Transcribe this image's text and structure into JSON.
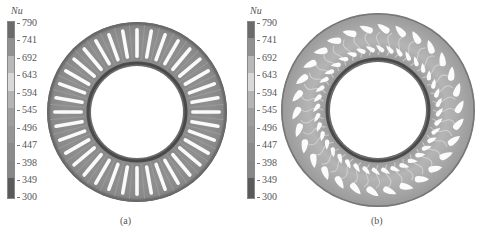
{
  "figure": {
    "colorbar": {
      "title": "Nu",
      "ticks": [
        "790",
        "741",
        "692",
        "643",
        "594",
        "545",
        "496",
        "447",
        "398",
        "349",
        "300"
      ],
      "segment_colors": [
        "#6b6b6b",
        "#8e8e8e",
        "#b4b4b4",
        "#d6d6d6",
        "#b6b6b6",
        "#9d9d9d",
        "#939393",
        "#8a8a8a",
        "#888888",
        "#6a6a6a",
        "#444444"
      ]
    },
    "panels": [
      {
        "id": "a",
        "caption": "(a)",
        "colorbar_title": "Nu"
      },
      {
        "id": "b",
        "caption": "(b)",
        "colorbar_title": "Nu"
      }
    ]
  }
}
